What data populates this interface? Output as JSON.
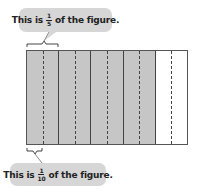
{
  "callouts": [
    {
      "prefix": "This is",
      "numerator": "1",
      "denominator": "5",
      "suffix": "of the figure."
    },
    {
      "prefix": "This is",
      "numerator": "1",
      "denominator": "10",
      "suffix": "of the figure."
    }
  ],
  "figure": {
    "columns": 5,
    "shaded_columns": 4,
    "subdivisions_per_column": 2,
    "shaded_color": "#c6c6c6",
    "unshaded_color": "#ffffff"
  }
}
